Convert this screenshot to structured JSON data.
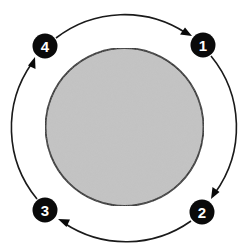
{
  "diagram": {
    "type": "cycle",
    "colors": {
      "background": "#ffffff",
      "center_fill": "#c4c4c4",
      "center_stroke": "#1a1a1a",
      "ring_stroke": "#1a1a1a",
      "badge_fill": "#0a0a0a",
      "badge_text": "#ffffff"
    },
    "steps": [
      {
        "label": "1",
        "position": "top-right"
      },
      {
        "label": "2",
        "position": "bottom-right"
      },
      {
        "label": "3",
        "position": "bottom-left"
      },
      {
        "label": "4",
        "position": "top-left"
      }
    ],
    "flow": [
      {
        "from": "4",
        "to": "1",
        "direction": "clockwise"
      },
      {
        "from": "1",
        "to": "2",
        "direction": "clockwise"
      },
      {
        "from": "2",
        "to": "3",
        "direction": "clockwise"
      },
      {
        "from": "3",
        "to": "4",
        "direction": "clockwise"
      }
    ]
  }
}
